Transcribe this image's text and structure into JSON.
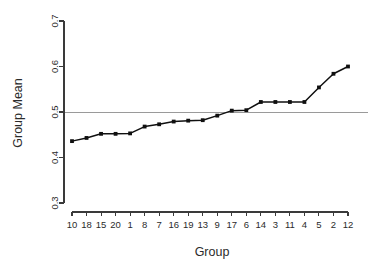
{
  "chart_data": {
    "type": "line",
    "title": "",
    "subtitle": "",
    "xlabel": "Group",
    "ylabel": "Group Mean",
    "categories": [
      "10",
      "18",
      "15",
      "20",
      "1",
      "8",
      "7",
      "16",
      "19",
      "13",
      "9",
      "17",
      "6",
      "14",
      "3",
      "11",
      "4",
      "5",
      "2",
      "12"
    ],
    "values": [
      0.436,
      0.443,
      0.452,
      0.452,
      0.453,
      0.468,
      0.473,
      0.479,
      0.481,
      0.482,
      0.492,
      0.503,
      0.504,
      0.522,
      0.522,
      0.522,
      0.522,
      0.554,
      0.584,
      0.6
    ],
    "series": [
      {
        "name": "Group Mean",
        "values": [
          0.436,
          0.443,
          0.452,
          0.452,
          0.453,
          0.468,
          0.473,
          0.479,
          0.481,
          0.482,
          0.492,
          0.503,
          0.504,
          0.522,
          0.522,
          0.522,
          0.522,
          0.554,
          0.584,
          0.6
        ],
        "marker": "filled-square",
        "color": "#101010"
      }
    ],
    "ylim": [
      0.3,
      0.7
    ],
    "yticks": [
      0.3,
      0.4,
      0.5,
      0.6,
      0.7
    ],
    "ytick_labels": [
      "0.3",
      "0.4",
      "0.5",
      "0.6",
      "0.7"
    ],
    "xtick_labels": [
      "10",
      "18",
      "15",
      "20",
      "1",
      "8",
      "7",
      "16",
      "19",
      "13",
      "9",
      "17",
      "6",
      "14",
      "3",
      "11",
      "4",
      "5",
      "2",
      "12"
    ],
    "grid": false,
    "legend": "none",
    "annotations": [
      {
        "type": "hline",
        "value": 0.5,
        "color": "#9a9a9a",
        "label": "reference line at 0.5"
      }
    ],
    "colors": {
      "line": "#101010",
      "marker": "#101010",
      "axis": "#3a3a3a",
      "reference_line": "#9a9a9a",
      "background": "#ffffff",
      "text": "#2b2b2b"
    }
  }
}
